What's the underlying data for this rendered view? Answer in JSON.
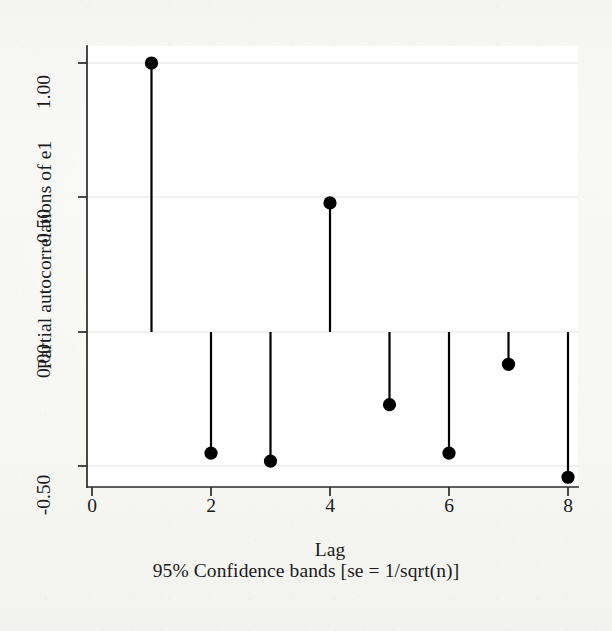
{
  "chart_data": {
    "type": "bar",
    "title": "",
    "subtitle": "95% Confidence bands [se = 1/sqrt(n)]",
    "xlabel": "Lag",
    "ylabel": "Partial autocorrelations of e1",
    "x": [
      1,
      2,
      3,
      4,
      5,
      6,
      7,
      8
    ],
    "values": [
      1.0,
      -0.45,
      -0.48,
      0.48,
      -0.27,
      -0.45,
      -0.12,
      -0.54
    ],
    "categories": [
      "1",
      "2",
      "3",
      "4",
      "5",
      "6",
      "7",
      "8"
    ],
    "series": [
      {
        "name": "Partial autocorrelations of e1",
        "values": [
          1.0,
          -0.45,
          -0.48,
          0.48,
          -0.27,
          -0.45,
          -0.12,
          -0.54
        ]
      }
    ],
    "xlim": [
      0,
      8.45
    ],
    "ylim": [
      -0.62,
      1.06
    ],
    "xticks": [
      0,
      2,
      4,
      6,
      8
    ],
    "xtick_labels": [
      "0",
      "2",
      "4",
      "6",
      "8"
    ],
    "yticks": [
      1.0,
      0.5,
      0.0,
      -0.5
    ],
    "ytick_labels": [
      "1.00",
      "0.50",
      "0.00",
      "-0.50"
    ],
    "grid": true,
    "grid_axis": "y",
    "legend": "none",
    "marker": "filled-circle",
    "marker_color": "#000000",
    "stem_color": "#000000",
    "baseline": 0.0,
    "plot_background": "#ffffff",
    "figure_background": "#f7f7f5"
  },
  "axes": {
    "y_title": "Partial autocorrelations of e1",
    "x_title": "Lag",
    "note": "95% Confidence bands [se = 1/sqrt(n)]",
    "y_ticks": [
      "1.00",
      "0.50",
      "0.00",
      "-0.50"
    ],
    "x_ticks": [
      "0",
      "2",
      "4",
      "6",
      "8"
    ]
  }
}
